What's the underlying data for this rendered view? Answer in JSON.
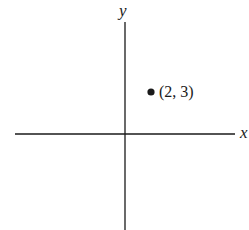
{
  "diagram": {
    "type": "coordinate-plane",
    "x_axis_label": "x",
    "y_axis_label": "y",
    "point": {
      "x": 2,
      "y": 3,
      "label": "(2, 3)"
    },
    "colors": {
      "ink": "#1a1a1a",
      "background": "#ffffff"
    }
  }
}
